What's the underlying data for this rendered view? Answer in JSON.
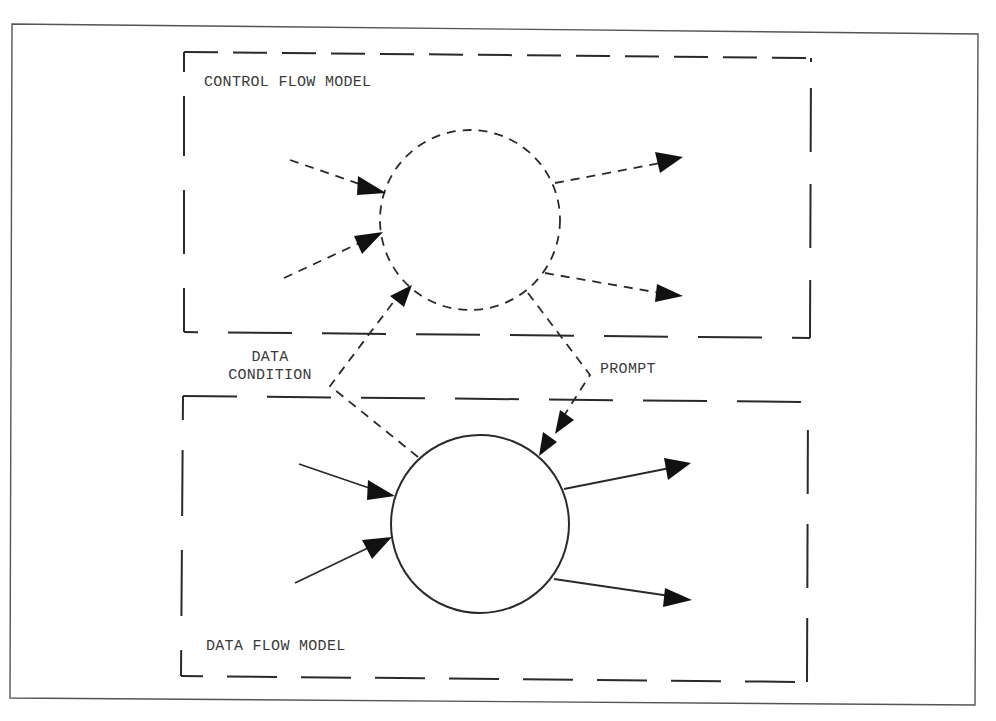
{
  "diagram": {
    "colors": {
      "stroke": "#2a2a2a",
      "frame": "#555555",
      "text": "#3a3a3a",
      "background": "#ffffff"
    },
    "regions": {
      "control_flow": {
        "label": "CONTROL FLOW MODEL"
      },
      "data_flow": {
        "label": "DATA FLOW MODEL"
      }
    },
    "nodes": [
      {
        "id": "control-process",
        "style": "dashed-circle",
        "region": "control_flow"
      },
      {
        "id": "data-process",
        "style": "solid-circle",
        "region": "data_flow"
      }
    ],
    "connectors": {
      "data_condition": {
        "label_line1": "DATA",
        "label_line2": "CONDITION",
        "from": "data-process",
        "to": "control-process",
        "style": "dashed"
      },
      "prompt": {
        "label": "PROMPT",
        "from": "control-process",
        "to": "data-process",
        "style": "dashed"
      }
    },
    "control_flow_arrows": {
      "inputs": 2,
      "outputs": 2,
      "style": "dashed"
    },
    "data_flow_arrows": {
      "inputs": 2,
      "outputs": 2,
      "style": "solid"
    }
  }
}
